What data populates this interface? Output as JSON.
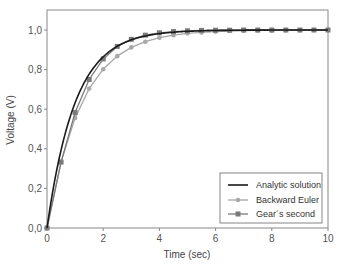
{
  "chart_data": {
    "type": "line",
    "title": "",
    "xlabel": "Time (sec)",
    "ylabel": "Voltage (V)",
    "xlim": [
      0,
      10
    ],
    "ylim": [
      0,
      1.1
    ],
    "x_ticks": [
      "0",
      "2",
      "4",
      "6",
      "8",
      "10"
    ],
    "y_ticks": [
      "0,0",
      "0,2",
      "0,4",
      "0,6",
      "0,8",
      "1,0"
    ],
    "grid": false,
    "legend_position": "lower right",
    "series": [
      {
        "name": "Analytic solution",
        "style": "line",
        "color": "#1a1a1a",
        "x": [
          0,
          0.25,
          0.5,
          0.75,
          1,
          1.25,
          1.5,
          1.75,
          2,
          2.5,
          3,
          3.5,
          4,
          4.5,
          5,
          6,
          7,
          8,
          9,
          10
        ],
        "values": [
          0,
          0.221,
          0.393,
          0.528,
          0.632,
          0.713,
          0.777,
          0.826,
          0.865,
          0.918,
          0.95,
          0.97,
          0.982,
          0.989,
          0.993,
          0.998,
          0.999,
          1.0,
          1.0,
          1.0
        ]
      },
      {
        "name": "Backward Euler",
        "style": "line-marker-circle",
        "color": "#a8a8a8",
        "x": [
          0,
          0.5,
          1,
          1.5,
          2,
          2.5,
          3,
          3.5,
          4,
          4.5,
          5,
          5.5,
          6,
          6.5,
          7,
          7.5,
          8,
          8.5,
          9,
          9.5,
          10
        ],
        "values": [
          0,
          0.333,
          0.556,
          0.704,
          0.802,
          0.868,
          0.912,
          0.941,
          0.961,
          0.974,
          0.983,
          0.988,
          0.992,
          0.995,
          0.997,
          0.998,
          0.998,
          0.999,
          0.999,
          1.0,
          1.0
        ]
      },
      {
        "name": "Gear's second",
        "style": "line-marker-square",
        "color": "#7a7a7a",
        "x": [
          0,
          0.5,
          1,
          1.5,
          2,
          2.5,
          3,
          3.5,
          4,
          4.5,
          5,
          5.5,
          6,
          6.5,
          7,
          7.5,
          8,
          8.5,
          9,
          9.5,
          10
        ],
        "values": [
          0,
          0.333,
          0.583,
          0.75,
          0.854,
          0.917,
          0.953,
          0.974,
          0.986,
          0.992,
          0.996,
          0.998,
          0.999,
          0.999,
          1.0,
          1.0,
          1.0,
          1.0,
          1.0,
          1.0,
          1.0
        ]
      }
    ]
  },
  "legend": {
    "items": [
      "Analytic solution",
      "Backward Euler",
      "Gear´s second"
    ]
  }
}
